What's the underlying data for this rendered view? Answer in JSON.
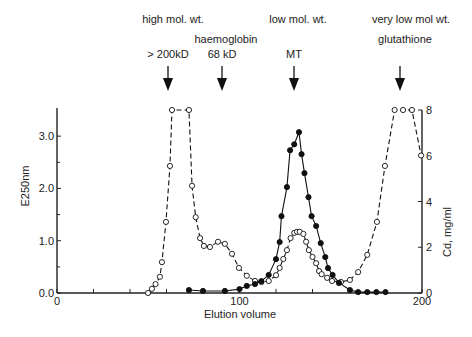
{
  "chart_data": {
    "type": "line",
    "title": "",
    "xlabel": "Elution volume",
    "ylabel": "E250nm",
    "y2label": "Cd, mg/ml",
    "xlim": [
      0,
      200
    ],
    "ylim": [
      0,
      3.5
    ],
    "y2lim": [
      0,
      8
    ],
    "x_ticks": [
      0,
      100,
      200
    ],
    "x_minor_ticks": [
      20,
      40,
      60,
      80,
      120,
      140,
      160,
      180
    ],
    "y_ticks": [
      "0.0",
      "1.0",
      "2.0",
      "3.0"
    ],
    "y_tick_values": [
      0,
      1,
      2,
      3
    ],
    "y2_ticks": [
      "0",
      "2",
      "4",
      "6",
      "8"
    ],
    "y2_tick_values": [
      0,
      2,
      4,
      6,
      8
    ],
    "grid": false,
    "legend": null,
    "annotations": [
      {
        "x": 61,
        "lines": [
          "high mol. wt.",
          "",
          "> 200kD"
        ],
        "arrow": true
      },
      {
        "x": 90,
        "lines": [
          "",
          "haemoglobin",
          "68 kD"
        ],
        "arrow": true
      },
      {
        "x": 130,
        "lines": [
          "low mol. wt.",
          "",
          "MT"
        ],
        "arrow": true
      },
      {
        "x": 188,
        "lines": [
          "very low mol wt.",
          "glutathione",
          ""
        ],
        "arrow": true
      }
    ],
    "series": [
      {
        "name": "E250nm",
        "axis": "left",
        "marker": "open-circle",
        "line": "dashed",
        "x": [
          49.9,
          52,
          54,
          56.4,
          57.5,
          59.7,
          61.9,
          63,
          72.3,
          74,
          76,
          78.4,
          80.5,
          83.8,
          88.2,
          92,
          95.9,
          99.7,
          104,
          108.5,
          112,
          116,
          120,
          122,
          124,
          126,
          128,
          130,
          131.5,
          133,
          135,
          136.5,
          138,
          140,
          142,
          143.6,
          145,
          148,
          150.7,
          155.6,
          160.5,
          165,
          170,
          175.3,
          179.7,
          185,
          189.6,
          194.5,
          199.5
        ],
        "values": [
          0.0,
          0.08,
          0.17,
          0.31,
          0.59,
          1.36,
          2.43,
          3.5,
          3.5,
          2.05,
          1.45,
          1.05,
          0.9,
          0.88,
          0.98,
          0.94,
          0.75,
          0.48,
          0.33,
          0.23,
          0.21,
          0.23,
          0.34,
          0.48,
          0.65,
          0.82,
          1.05,
          1.15,
          1.17,
          1.17,
          1.13,
          0.98,
          0.82,
          0.69,
          0.57,
          0.42,
          0.36,
          0.29,
          0.23,
          0.21,
          0.25,
          0.4,
          0.73,
          1.36,
          2.43,
          3.5,
          3.5,
          3.5,
          2.63
        ]
      },
      {
        "name": "Cd, mg/ml",
        "axis": "right",
        "marker": "filled-circle",
        "line": "solid",
        "x": [
          72.3,
          80,
          92,
          100,
          104,
          108.5,
          112,
          116,
          120,
          122,
          123,
          126,
          127.7,
          130,
          132.6,
          134,
          135.6,
          137.8,
          139.5,
          142,
          144.5,
          147,
          148.5,
          151,
          154.5,
          160.5,
          165,
          170,
          175,
          180
        ],
        "values": [
          0.13,
          0.09,
          0.09,
          0.17,
          0.31,
          0.39,
          0.52,
          0.79,
          1.48,
          2.23,
          3.36,
          4.63,
          6.24,
          6.5,
          7.03,
          6.07,
          5.24,
          4.19,
          3.36,
          2.93,
          2.18,
          1.57,
          1.09,
          0.79,
          0.44,
          0.13,
          0.04,
          0.04,
          0.04,
          0.04
        ]
      }
    ]
  }
}
